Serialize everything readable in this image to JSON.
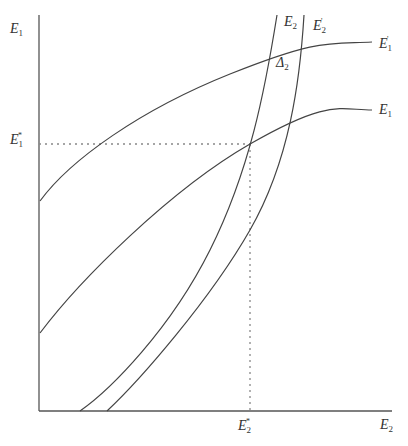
{
  "diagram": {
    "axes": {
      "y_label": {
        "base": "E",
        "sub": "1"
      },
      "x_label": {
        "base": "E",
        "sub": "2"
      },
      "y_tick": {
        "base": "E",
        "sub": "1",
        "sup": "*"
      },
      "x_tick": {
        "base": "E",
        "sub": "2",
        "sup": "*"
      }
    },
    "curves": [
      {
        "id": "E1-prime",
        "label": {
          "base": "E",
          "sub": "1",
          "sup": "'"
        }
      },
      {
        "id": "E1",
        "label": {
          "base": "E",
          "sub": "1"
        }
      },
      {
        "id": "E2",
        "label": {
          "base": "E",
          "sub": "2"
        }
      },
      {
        "id": "E2-prime",
        "label": {
          "base": "E",
          "sub": "2",
          "sup": "'"
        }
      }
    ],
    "annotation": {
      "base": "Δ",
      "sub": "2"
    },
    "colors": {
      "line": "#444444",
      "dotted": "#888888"
    }
  }
}
